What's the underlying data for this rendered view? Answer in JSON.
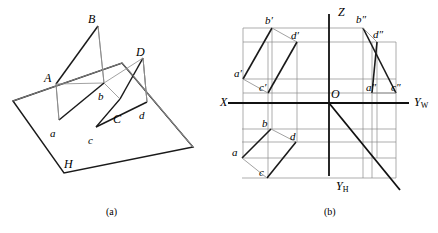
{
  "figure": {
    "captions": [
      {
        "id": "caption-a",
        "text": "(a)",
        "x": 106,
        "y": 206
      },
      {
        "id": "caption-b",
        "text": "(b)",
        "x": 324,
        "y": 206
      }
    ],
    "stroke_color": "#1a1a1a",
    "thin_color": "#6e6e6e",
    "background": "#ffffff"
  },
  "pictorial": {
    "name": "three-dimensional pictorial view",
    "plane_label": "H",
    "labels": [
      {
        "id": "vertex-A",
        "text": "A",
        "x": 44,
        "y": 72
      },
      {
        "id": "vertex-B",
        "text": "B",
        "x": 88,
        "y": 13
      },
      {
        "id": "vertex-D",
        "text": "D",
        "x": 136,
        "y": 46
      },
      {
        "id": "vertex-C",
        "text": "C",
        "x": 113,
        "y": 113
      },
      {
        "id": "vertex-a",
        "text": "a",
        "x": 50,
        "y": 128
      },
      {
        "id": "vertex-b",
        "text": "b",
        "x": 98,
        "y": 91
      },
      {
        "id": "vertex-c",
        "text": "c",
        "x": 88,
        "y": 135
      },
      {
        "id": "vertex-d",
        "text": "d",
        "x": 139,
        "y": 110
      },
      {
        "id": "plane-H",
        "text": "H",
        "x": 64,
        "y": 158
      }
    ],
    "ground_plane": {
      "points": "13,101 122,63 193,147 64,173",
      "description": "horizontal projection plane H parallelogram"
    },
    "quadrilateral_3d": {
      "A": [
        56,
        84
      ],
      "B": [
        98,
        26
      ],
      "D": [
        143,
        58
      ],
      "C": [
        120,
        99
      ]
    },
    "quadrilateral_proj": {
      "a": [
        59,
        120
      ],
      "b": [
        104,
        83
      ],
      "c": [
        96,
        127
      ],
      "d": [
        147,
        102
      ]
    }
  },
  "orthographic": {
    "name": "three-view orthographic projection",
    "origin": {
      "x": 329,
      "y": 103
    },
    "axes": [
      {
        "id": "axis-X",
        "text": "X",
        "x": 220,
        "y": 96
      },
      {
        "id": "axis-Z",
        "text": "Z",
        "x": 338,
        "y": 6
      },
      {
        "id": "axis-YW",
        "text": "Y",
        "sub": "W",
        "x": 414,
        "y": 96
      },
      {
        "id": "axis-YH",
        "text": "Y",
        "sub": "H",
        "x": 336,
        "y": 180
      },
      {
        "id": "origin-O",
        "text": "O",
        "x": 331,
        "y": 88
      }
    ],
    "labels": [
      {
        "id": "v-proj-a",
        "text": "a′",
        "x": 234,
        "y": 68
      },
      {
        "id": "v-proj-b",
        "text": "b′",
        "x": 265,
        "y": 15
      },
      {
        "id": "v-proj-c",
        "text": "c′",
        "x": 259,
        "y": 82
      },
      {
        "id": "v-proj-d",
        "text": "d′",
        "x": 291,
        "y": 30
      },
      {
        "id": "w-proj-a",
        "text": "a″",
        "x": 366,
        "y": 82
      },
      {
        "id": "w-proj-b",
        "text": "b″",
        "x": 356,
        "y": 14
      },
      {
        "id": "w-proj-c",
        "text": "c″",
        "x": 391,
        "y": 82
      },
      {
        "id": "w-proj-d",
        "text": "d″",
        "x": 373,
        "y": 29
      },
      {
        "id": "h-proj-a",
        "text": "a",
        "x": 232,
        "y": 147
      },
      {
        "id": "h-proj-b",
        "text": "b",
        "x": 262,
        "y": 118
      },
      {
        "id": "h-proj-c",
        "text": "c",
        "x": 259,
        "y": 167
      },
      {
        "id": "h-proj-d",
        "text": "d",
        "x": 290,
        "y": 131
      }
    ],
    "points": {
      "a_v": [
        243,
        79
      ],
      "b_v": [
        272,
        28
      ],
      "c_v": [
        268,
        93
      ],
      "d_v": [
        297,
        42
      ],
      "a_w": [
        372,
        93
      ],
      "b_w": [
        363,
        28
      ],
      "c_w": [
        396,
        93
      ],
      "d_w": [
        377,
        42
      ],
      "a_h": [
        242,
        158
      ],
      "b_h": [
        271,
        129
      ],
      "c_h": [
        267,
        178
      ],
      "d_h": [
        296,
        142
      ]
    }
  }
}
